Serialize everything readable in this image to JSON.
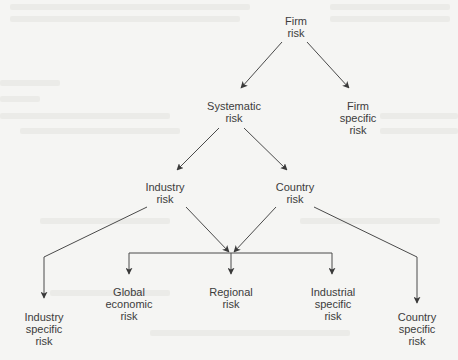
{
  "diagram": {
    "title": "",
    "type": "tree",
    "colors": {
      "line": "#4a4a4a",
      "text": "#3c3c3c",
      "background": "#f5f5f3"
    },
    "nodes": {
      "firm_risk": {
        "line1": "Firm",
        "line2": "risk"
      },
      "systematic_risk": {
        "line1": "Systematic",
        "line2": "risk"
      },
      "firm_specific_risk": {
        "line1": "Firm",
        "line2": "specific",
        "line3": "risk"
      },
      "industry_risk": {
        "line1": "Industry",
        "line2": "risk"
      },
      "country_risk": {
        "line1": "Country",
        "line2": "risk"
      },
      "industry_specific_risk": {
        "line1": "Industry",
        "line2": "specific",
        "line3": "risk"
      },
      "global_economic_risk": {
        "line1": "Global",
        "line2": "economic",
        "line3": "risk"
      },
      "regional_risk": {
        "line1": "Regional",
        "line2": "risk"
      },
      "industrial_specific_risk": {
        "line1": "Industrial",
        "line2": "specific",
        "line3": "risk"
      },
      "country_specific_risk": {
        "line1": "Country",
        "line2": "specific",
        "line3": "risk"
      }
    },
    "edges": [
      {
        "from": "Firm risk",
        "to": "Systematic risk"
      },
      {
        "from": "Firm risk",
        "to": "Firm specific risk"
      },
      {
        "from": "Systematic risk",
        "to": "Industry risk"
      },
      {
        "from": "Systematic risk",
        "to": "Country risk"
      },
      {
        "from": "Industry risk",
        "to": "Industry specific risk"
      },
      {
        "from": "Industry risk",
        "to": "Global economic risk / Regional risk / Industrial specific risk"
      },
      {
        "from": "Country risk",
        "to": "Global economic risk / Regional risk / Industrial specific risk"
      },
      {
        "from": "Country risk",
        "to": "Country specific risk"
      }
    ]
  }
}
